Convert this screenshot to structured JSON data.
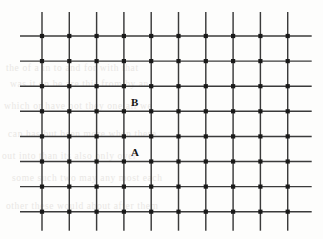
{
  "figure": {
    "name": "square-lattice-diagram",
    "background_color": "#fdfdfc",
    "line_color": "#3b3b3b",
    "node_color": "#1a1a1a",
    "label_color": "#141414"
  },
  "labels": {
    "site_b": "B",
    "site_a": "A"
  },
  "chart_data": {
    "type": "scatter",
    "title": "",
    "xlabel": "",
    "ylabel": "",
    "columns": 10,
    "rows": 8,
    "x_spacing": 27.3,
    "y_spacing": 25.1,
    "x_origin": 42,
    "y_origin": 36,
    "overhang": {
      "left": 22,
      "right": 24,
      "top": 24,
      "bottom": 19
    },
    "x": [
      42,
      69.3,
      96.6,
      123.9,
      151.2,
      178.5,
      205.8,
      233.1,
      260.4,
      287.7
    ],
    "y": [
      36,
      61.1,
      86.2,
      111.3,
      136.4,
      161.5,
      186.6,
      211.7
    ],
    "node_size": 4.2,
    "grid": true,
    "annotations": [
      {
        "text": "B",
        "column_index": 4,
        "between_rows": [
          1,
          2
        ],
        "x": 131,
        "y": 97
      },
      {
        "text": "A",
        "column_index": 4,
        "between_rows": [
          3,
          4
        ],
        "x": 131,
        "y": 147
      }
    ]
  },
  "background_artifacts": [
    {
      "text": "the  of  a  in  to  and  for  with  that"
    },
    {
      "text": "was  it  on  be  are  this  from  by  an"
    },
    {
      "text": "which  or  have  not  they  one  all  we"
    },
    {
      "text": "can  has  but  been  more  when  there"
    },
    {
      "text": "out  into  than  its  also  only  over"
    },
    {
      "text": "some  such  two  may  any  most  each"
    },
    {
      "text": "other  these  would  about  after  them"
    }
  ]
}
